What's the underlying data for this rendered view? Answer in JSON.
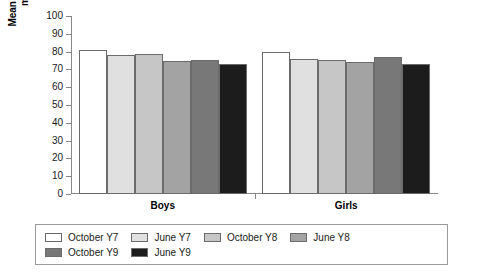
{
  "chart_data": {
    "type": "bar",
    "title": "",
    "subtitle": "",
    "xlabel": "",
    "ylabel": "Mean score as a per cent of maximum possible",
    "ylim": [
      0,
      100
    ],
    "ytick_step": 10,
    "yticks": [
      100,
      90,
      80,
      70,
      60,
      50,
      40,
      30,
      20,
      10,
      0
    ],
    "grid": false,
    "legend_position": "bottom",
    "categories": [
      "Boys",
      "Girls"
    ],
    "series": [
      {
        "name": "October Y7",
        "color": "#ffffff",
        "values": [
          81,
          80
        ]
      },
      {
        "name": "June Y7",
        "color": "#e0e0e0",
        "values": [
          78,
          76
        ]
      },
      {
        "name": "October Y8",
        "color": "#c6c6c6",
        "values": [
          78.5,
          75.5
        ]
      },
      {
        "name": "June Y8",
        "color": "#a3a3a3",
        "values": [
          75,
          74
        ]
      },
      {
        "name": "October Y9",
        "color": "#787878",
        "values": [
          75.5,
          77
        ]
      },
      {
        "name": "June Y9",
        "color": "#1c1c1c",
        "values": [
          73,
          73
        ]
      }
    ]
  },
  "y_axis": {
    "title_line1": "Mean score as a per cent of",
    "title_line2": "maximum possible"
  },
  "legend": {
    "items": [
      {
        "label": "October Y7"
      },
      {
        "label": "June Y7"
      },
      {
        "label": "October Y8"
      },
      {
        "label": "June Y8"
      },
      {
        "label": "October Y9"
      },
      {
        "label": "June Y9"
      }
    ]
  }
}
